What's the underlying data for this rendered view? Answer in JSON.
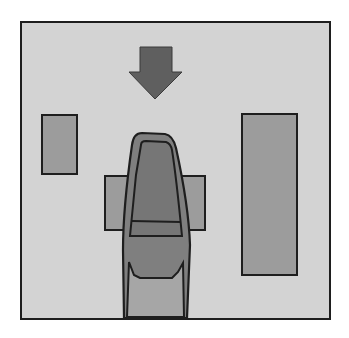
{
  "diagram": {
    "type": "top-down driving scene",
    "canvas": {
      "x": 21,
      "y": 22,
      "width": 309,
      "height": 297
    },
    "colors": {
      "page_background": "#ffffff",
      "canvas_fill": "#d3d3d3",
      "outline": "#1e1e1e",
      "obstacle_fill": "#9c9c9c",
      "arrow_fill": "#5f5f5f",
      "car_body_fill": "#7f7f7f",
      "car_windshield_fill": "#767676",
      "car_hood_fill": "#a6a6a6"
    },
    "elements": [
      {
        "id": "direction-arrow",
        "kind": "arrow",
        "direction": "down",
        "shaft": {
          "x": 140,
          "y": 47,
          "width": 32,
          "height": 25
        },
        "head_left_x": 129,
        "head_right_x": 182,
        "head_y": 72,
        "tip": {
          "x": 155,
          "y": 99
        }
      },
      {
        "id": "obstacle-left",
        "kind": "rectangle",
        "x": 42,
        "y": 115,
        "width": 35,
        "height": 59
      },
      {
        "id": "obstacle-right",
        "kind": "rectangle",
        "x": 242,
        "y": 114,
        "width": 55,
        "height": 161
      },
      {
        "id": "obstacle-center",
        "kind": "rectangle",
        "x": 105,
        "y": 176,
        "width": 100,
        "height": 54
      },
      {
        "id": "car",
        "kind": "vehicle",
        "heading": "up",
        "front_y": 132,
        "rear_y": 318,
        "left_x": 123,
        "right_x": 191
      }
    ]
  }
}
